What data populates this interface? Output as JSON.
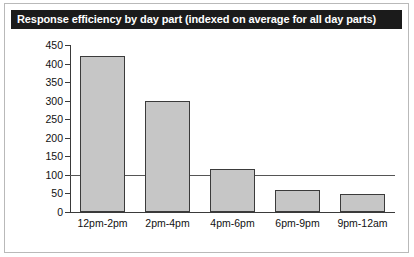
{
  "figure": {
    "title": "Response efficiency by day part (indexed on average for all day parts)",
    "title_bar_color": "#1b1b1b",
    "title_text_color": "#ffffff",
    "background_color": "#ffffff",
    "frame_color": "#b9b9b9"
  },
  "chart_data": {
    "type": "bar",
    "title": "Response efficiency by day part (indexed on average for all day parts)",
    "categories": [
      "12pm-2pm",
      "2pm-4pm",
      "4pm-6pm",
      "6pm-9pm",
      "9pm-12am"
    ],
    "values": [
      420,
      298,
      115,
      58,
      48
    ],
    "xlabel": "",
    "ylabel": "",
    "ylim": [
      0,
      450
    ],
    "yticks": [
      0,
      50,
      100,
      150,
      200,
      250,
      300,
      350,
      400,
      450
    ],
    "ytick_labels": [
      "0",
      "50",
      "100",
      "150",
      "200",
      "250",
      "300",
      "350",
      "400",
      "450"
    ],
    "grid": false,
    "legend": null,
    "reference_line": {
      "value": 100,
      "label": "index average = 100",
      "color": "#555555"
    },
    "bar_fill_color": "#c6c6c6",
    "bar_edge_color": "#3b3b3b",
    "axis_color": "#3a3a3a"
  }
}
